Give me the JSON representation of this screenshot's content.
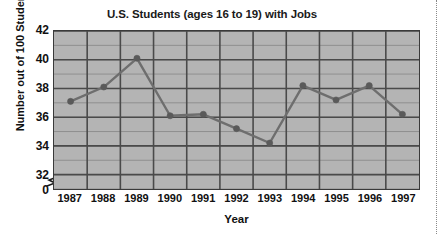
{
  "chart_data": {
    "type": "line",
    "title": "U.S. Students (ages 16 to 19) with Jobs",
    "xlabel": "Year",
    "ylabel": "Number out of 100 Students",
    "categories": [
      "1987",
      "1988",
      "1989",
      "1990",
      "1991",
      "1992",
      "1993",
      "1994",
      "1995",
      "1996",
      "1997"
    ],
    "values": [
      37.1,
      38.1,
      40.1,
      36.1,
      36.2,
      35.2,
      34.2,
      38.2,
      37.2,
      38.2,
      36.2
    ],
    "x_tick_labels": [
      "1987",
      "1988",
      "1989",
      "1990",
      "1991",
      "1992",
      "1993",
      "1994",
      "1995",
      "1996",
      "1997"
    ],
    "y_tick_labels": [
      "0",
      "32",
      "34",
      "36",
      "38",
      "40",
      "42"
    ],
    "y_tick_values": [
      0,
      32,
      34,
      36,
      38,
      40,
      42
    ],
    "ylim": [
      31,
      42
    ],
    "y_axis_break": true,
    "y_axis_break_between": [
      0,
      32
    ],
    "grid": true,
    "grid_minor_step": 1,
    "legend": null,
    "series": [
      {
        "name": "U.S. students with jobs (per 100)",
        "values": [
          37.1,
          38.1,
          40.1,
          36.1,
          36.2,
          35.2,
          34.2,
          38.2,
          37.2,
          38.2,
          36.2
        ]
      }
    ],
    "colors": {
      "plot_background": "#b4b4b4",
      "gridline_major": "#4a4a4a",
      "gridline_minor": "#8f8f8f",
      "line": "#6e6e6e",
      "marker": "#5a5a5a",
      "axis": "#3a3a3a",
      "text": "#111111",
      "page_background": "#ffffff"
    }
  }
}
